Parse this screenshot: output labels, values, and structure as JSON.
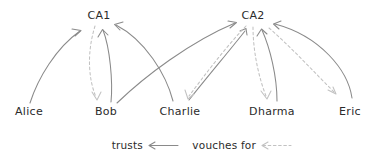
{
  "diagram": {
    "title_text": "",
    "style": {
      "background": "#ffffff",
      "solid_stroke": "#8a8a8a",
      "dashed_stroke": "#c2c2c2",
      "text_color": "#2b2b2b"
    },
    "ca_nodes": [
      {
        "id": "ca1",
        "label": "CA1",
        "x": 99,
        "y": 19
      },
      {
        "id": "ca2",
        "label": "CA2",
        "x": 253,
        "y": 19
      }
    ],
    "person_nodes": [
      {
        "id": "alice",
        "label": "Alice",
        "x": 29,
        "y": 115
      },
      {
        "id": "bob",
        "label": "Bob",
        "x": 106,
        "y": 115
      },
      {
        "id": "charlie",
        "label": "Charlie",
        "x": 180,
        "y": 115
      },
      {
        "id": "dharma",
        "label": "Dharma",
        "x": 272,
        "y": 115
      },
      {
        "id": "eric",
        "label": "Eric",
        "x": 350,
        "y": 115
      }
    ],
    "edges": [
      {
        "from": "alice",
        "to": "ca1",
        "relation": "trusts"
      },
      {
        "from": "bob",
        "to": "ca1",
        "relation": "trusts"
      },
      {
        "from": "charlie",
        "to": "ca1",
        "relation": "trusts"
      },
      {
        "from": "bob",
        "to": "ca2",
        "relation": "trusts"
      },
      {
        "from": "charlie",
        "to": "ca2",
        "relation": "trusts"
      },
      {
        "from": "dharma",
        "to": "ca2",
        "relation": "trusts"
      },
      {
        "from": "eric",
        "to": "ca2",
        "relation": "trusts"
      },
      {
        "from": "ca1",
        "to": "bob",
        "relation": "vouches for"
      },
      {
        "from": "ca2",
        "to": "charlie",
        "relation": "vouches for"
      },
      {
        "from": "ca2",
        "to": "dharma",
        "relation": "vouches for"
      },
      {
        "from": "ca2",
        "to": "eric",
        "relation": "vouches for"
      }
    ]
  },
  "legend": {
    "entries": [
      {
        "id": "trusts",
        "label": "trusts",
        "line_style": "solid",
        "color": "#8a8a8a"
      },
      {
        "id": "vouches-for",
        "label": "vouches for",
        "line_style": "dashed",
        "color": "#c2c2c2"
      }
    ]
  }
}
